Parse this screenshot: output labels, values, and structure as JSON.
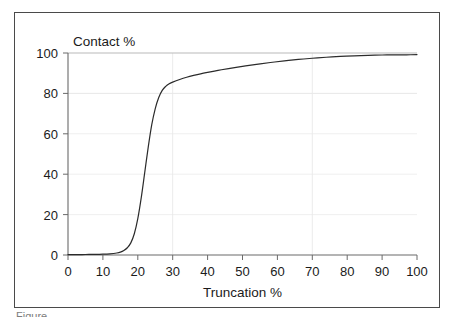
{
  "figure": {
    "frame_border_color": "#4a4a4a",
    "background_color": "#ffffff",
    "caption_partial": "Figure"
  },
  "chart_data": {
    "type": "line",
    "title": "",
    "xlabel": "Truncation %",
    "ylabel": "Contact %",
    "xlim": [
      0,
      100
    ],
    "ylim": [
      0,
      100
    ],
    "xticks": [
      0,
      10,
      20,
      30,
      40,
      50,
      60,
      70,
      80,
      90,
      100
    ],
    "yticks": [
      0,
      20,
      40,
      60,
      80,
      100
    ],
    "xtick_labels": [
      "0",
      "10",
      "20",
      "30",
      "40",
      "50",
      "60",
      "70",
      "80",
      "90",
      "100"
    ],
    "ytick_labels": [
      "0",
      "20",
      "40",
      "60",
      "80",
      "100"
    ],
    "grid": true,
    "grid_color": "#e9e9e9",
    "gridlines_x": [
      30,
      70
    ],
    "gridlines_y": [
      20,
      40,
      60,
      80,
      100
    ],
    "legend": null,
    "line_color": "#2b2b2b",
    "line_width": 1.2,
    "series": [
      {
        "name": "Contact vs Truncation",
        "x": [
          0,
          2,
          4,
          6,
          8,
          10,
          12,
          14,
          15,
          16,
          17,
          18,
          19,
          20,
          21,
          22,
          23,
          24,
          25,
          26,
          27,
          28,
          29,
          30,
          32,
          34,
          36,
          38,
          40,
          43,
          46,
          50,
          54,
          58,
          62,
          66,
          70,
          74,
          78,
          82,
          86,
          90,
          94,
          97,
          100
        ],
        "y": [
          0.2,
          0.2,
          0.2,
          0.3,
          0.3,
          0.4,
          0.6,
          1.0,
          1.4,
          2.2,
          3.6,
          6.0,
          10.5,
          18.0,
          28.5,
          41.0,
          53.5,
          64.5,
          72.5,
          78.0,
          81.5,
          83.5,
          84.8,
          85.6,
          86.9,
          88.0,
          88.9,
          89.7,
          90.4,
          91.4,
          92.3,
          93.4,
          94.4,
          95.3,
          96.1,
          96.8,
          97.4,
          97.9,
          98.3,
          98.6,
          98.8,
          99.0,
          99.1,
          99.1,
          99.2
        ]
      }
    ],
    "annotations": []
  },
  "plot_geometry": {
    "left_px": 53,
    "right_px": 402,
    "top_px": 40,
    "bottom_px": 242
  }
}
